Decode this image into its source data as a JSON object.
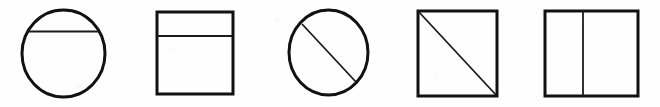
{
  "figure": {
    "canvas": {
      "width": 660,
      "height": 107
    },
    "colors": {
      "background": "#fefefe",
      "outline": "#111111",
      "interior_line": "#1a1a1a",
      "fill": "none"
    },
    "stroke": {
      "outline_width": 3.0,
      "interior_width": 1.8
    },
    "shapes": [
      {
        "index": 1,
        "name": "circle-with-horizontal-chord",
        "outline_shape": "circle",
        "division": "horizontal chord near top",
        "label": "Circle divided by a horizontal chord",
        "slot": {
          "x": 10,
          "width": 110
        },
        "geometry": {
          "cx": 63.5,
          "cy": 53.5,
          "rx": 41.5,
          "ry": 43.5,
          "line_x1": 27,
          "line_y1": 31.5,
          "line_x2": 100,
          "line_y2": 31.5
        }
      },
      {
        "index": 2,
        "name": "square-with-horizontal-line",
        "outline_shape": "square",
        "division": "horizontal line near top",
        "label": "Square divided by a horizontal line",
        "slot": {
          "x": 150,
          "width": 100
        },
        "geometry": {
          "x": 157,
          "y": 12,
          "width": 76,
          "height": 82,
          "line_x1": 157,
          "line_y1": 36,
          "line_x2": 233,
          "line_y2": 36
        }
      },
      {
        "index": 3,
        "name": "circle-with-diagonal-line",
        "outline_shape": "circle",
        "division": "diagonal from upper-left to lower-right",
        "label": "Circle divided by a diagonal line",
        "slot": {
          "x": 282,
          "width": 100
        },
        "geometry": {
          "cx": 328.5,
          "cy": 52.5,
          "rx": 39.5,
          "ry": 42.5,
          "line_x1": 302,
          "line_y1": 24,
          "line_x2": 356,
          "line_y2": 82
        }
      },
      {
        "index": 4,
        "name": "square-with-diagonal-line",
        "outline_shape": "square",
        "division": "diagonal corner to corner",
        "label": "Square divided by a corner-to-corner diagonal",
        "slot": {
          "x": 412,
          "width": 100
        },
        "geometry": {
          "x": 418,
          "y": 11,
          "width": 79,
          "height": 85,
          "line_x1": 418,
          "line_y1": 11,
          "line_x2": 497,
          "line_y2": 96
        }
      },
      {
        "index": 5,
        "name": "square-with-vertical-line",
        "outline_shape": "square",
        "division": "vertical line near center",
        "label": "Square divided by a vertical line",
        "slot": {
          "x": 540,
          "width": 110
        },
        "geometry": {
          "x": 545,
          "y": 11,
          "width": 93,
          "height": 85,
          "line_x1": 583,
          "line_y1": 11,
          "line_x2": 583,
          "line_y2": 96
        }
      }
    ]
  }
}
